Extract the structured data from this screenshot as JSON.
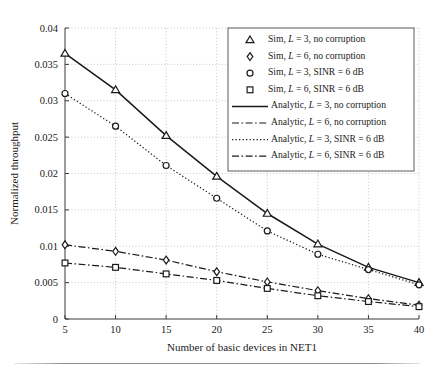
{
  "figure": {
    "background": "#ffffff",
    "foreground": "#1a1a1a",
    "grid_color": "#b9b9b9"
  },
  "chart_data": {
    "type": "line",
    "title": "",
    "xlabel": "Number of basic devices in NET1",
    "ylabel": "Normalized throughput",
    "xlim": [
      5,
      40
    ],
    "ylim": [
      0,
      0.04
    ],
    "xticks": [
      5,
      10,
      15,
      20,
      25,
      30,
      35,
      40
    ],
    "xtick_labels": [
      "5",
      "10",
      "15",
      "20",
      "25",
      "30",
      "35",
      "40"
    ],
    "yticks": [
      0,
      0.005,
      0.01,
      0.015,
      0.02,
      0.025,
      0.03,
      0.035,
      0.04
    ],
    "ytick_labels": [
      "0",
      "0.005",
      "0.01",
      "0.015",
      "0.02",
      "0.025",
      "0.03",
      "0.035",
      "0.04"
    ],
    "grid": true,
    "grid_style": "dotted",
    "legend_position": "upper right",
    "x": [
      5,
      10,
      15,
      20,
      25,
      30,
      35,
      40
    ],
    "series": [
      {
        "name": "Sim, L = 3, no corruption",
        "kind": "markers",
        "marker": "triangle",
        "values": [
          0.0365,
          0.0315,
          0.0252,
          0.0196,
          0.0145,
          0.0103,
          0.0071,
          0.005
        ]
      },
      {
        "name": "Sim, L = 6, no corruption",
        "kind": "markers",
        "marker": "diamond",
        "values": [
          0.0102,
          0.0093,
          0.0081,
          0.0065,
          0.0051,
          0.0039,
          0.0028,
          0.0019
        ]
      },
      {
        "name": "Sim, L = 3, SINR = 6 dB",
        "kind": "markers",
        "marker": "circle",
        "values": [
          0.031,
          0.0265,
          0.0211,
          0.0166,
          0.0121,
          0.0089,
          0.0068,
          0.0047
        ]
      },
      {
        "name": "Sim, L = 6, SINR = 6 dB",
        "kind": "markers",
        "marker": "square",
        "values": [
          0.0077,
          0.0071,
          0.0062,
          0.0053,
          0.0042,
          0.0032,
          0.0024,
          0.0017
        ]
      },
      {
        "name": "Analytic, L = 3, no corruption",
        "kind": "line",
        "style": "solid",
        "values": [
          0.0365,
          0.0315,
          0.0252,
          0.0196,
          0.0145,
          0.0103,
          0.0071,
          0.005
        ]
      },
      {
        "name": "Analytic, L = 6, no corruption",
        "kind": "line",
        "style": "dashdot",
        "values": [
          0.0102,
          0.0093,
          0.0081,
          0.0065,
          0.0051,
          0.0039,
          0.0028,
          0.0019
        ]
      },
      {
        "name": "Analytic, L = 3, SINR = 6 dB",
        "kind": "line",
        "style": "dotted",
        "values": [
          0.031,
          0.0265,
          0.0211,
          0.0166,
          0.0121,
          0.0089,
          0.0068,
          0.0047
        ]
      },
      {
        "name": "Analytic, L = 6, SINR = 6 dB",
        "kind": "line",
        "style": "dashdot",
        "values": [
          0.0077,
          0.0071,
          0.0062,
          0.0053,
          0.0042,
          0.0032,
          0.0024,
          0.0017
        ]
      }
    ],
    "legend": [
      {
        "label_prefix": "Sim, ",
        "label_var": "L",
        "label_suffix": " = 3, no corruption",
        "sample": "triangle",
        "sample_kind": "marker"
      },
      {
        "label_prefix": "Sim, ",
        "label_var": "L",
        "label_suffix": " = 6, no corruption",
        "sample": "diamond",
        "sample_kind": "marker"
      },
      {
        "label_prefix": "Sim, ",
        "label_var": "L",
        "label_suffix": " = 3, SINR = 6 dB",
        "sample": "circle",
        "sample_kind": "marker"
      },
      {
        "label_prefix": "Sim, ",
        "label_var": "L",
        "label_suffix": " = 6, SINR = 6 dB",
        "sample": "square",
        "sample_kind": "marker"
      },
      {
        "label_prefix": "Analytic, ",
        "label_var": "L",
        "label_suffix": " = 3, no corruption",
        "sample": "solid",
        "sample_kind": "line"
      },
      {
        "label_prefix": "Analytic, ",
        "label_var": "L",
        "label_suffix": " = 6, no corruption",
        "sample": "dashdot",
        "sample_kind": "line"
      },
      {
        "label_prefix": "Analytic, ",
        "label_var": "L",
        "label_suffix": " = 3, SINR = 6 dB",
        "sample": "dotted",
        "sample_kind": "line"
      },
      {
        "label_prefix": "Analytic, ",
        "label_var": "L",
        "label_suffix": " = 6, SINR = 6 dB",
        "sample": "dashdot",
        "sample_kind": "line"
      }
    ]
  }
}
